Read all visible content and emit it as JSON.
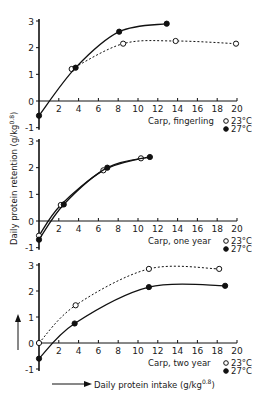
{
  "chart_data": [
    {
      "type": "line",
      "title": "Carp, fingerling",
      "xlabel": "Daily protein intake (g/kg^0.8)",
      "ylabel": "Daily protein retention (g/kg^0.8)",
      "xlim": [
        0,
        20
      ],
      "ylim": [
        -1,
        3
      ],
      "x_ticks": [
        2,
        4,
        6,
        8,
        10,
        12,
        14,
        16,
        18,
        20
      ],
      "y_ticks": [
        -1,
        0,
        1,
        2,
        3
      ],
      "grid": false,
      "series": [
        {
          "name": "23°C",
          "marker": "open-circle",
          "line": "dashed",
          "x": [
            3.3,
            8.5,
            13.8,
            19.9
          ],
          "y": [
            1.2,
            2.15,
            2.25,
            2.15
          ]
        },
        {
          "name": "27°C",
          "marker": "filled-circle",
          "line": "solid",
          "x": [
            0,
            3.7,
            8.1,
            12.9
          ],
          "y": [
            -0.55,
            1.25,
            2.6,
            2.9
          ]
        }
      ]
    },
    {
      "type": "line",
      "title": "Carp, one year",
      "xlabel": "Daily protein intake (g/kg^0.8)",
      "ylabel": "Daily protein retention (g/kg^0.8)",
      "xlim": [
        0,
        20
      ],
      "ylim": [
        -1,
        3
      ],
      "x_ticks": [
        2,
        4,
        6,
        8,
        10,
        12,
        14,
        16,
        18,
        20
      ],
      "y_ticks": [
        -1,
        0,
        1,
        2,
        3
      ],
      "grid": false,
      "series": [
        {
          "name": "23°C",
          "marker": "open-circle",
          "line": "solid",
          "x": [
            0,
            2.2,
            6.5,
            10.3
          ],
          "y": [
            -0.55,
            0.6,
            1.9,
            2.35
          ]
        },
        {
          "name": "27°C",
          "marker": "filled-circle",
          "line": "solid",
          "x": [
            0,
            2.5,
            6.9,
            11.2
          ],
          "y": [
            -0.7,
            0.62,
            2.0,
            2.4
          ]
        }
      ]
    },
    {
      "type": "line",
      "title": "Carp, two year",
      "xlabel": "Daily protein intake (g/kg^0.8)",
      "ylabel": "Daily protein retention (g/kg^0.8)",
      "xlim": [
        0,
        20
      ],
      "ylim": [
        -1,
        3
      ],
      "x_ticks": [
        2,
        4,
        6,
        8,
        10,
        12,
        14,
        16,
        18,
        20
      ],
      "y_ticks": [
        -1,
        0,
        1,
        2,
        3
      ],
      "grid": false,
      "series": [
        {
          "name": "23°C",
          "marker": "open-circle",
          "line": "dashed",
          "x": [
            0,
            3.7,
            11.1,
            18.2
          ],
          "y": [
            0,
            1.45,
            2.85,
            2.85
          ]
        },
        {
          "name": "27°C",
          "marker": "filled-circle",
          "line": "solid",
          "x": [
            0,
            3.6,
            11.1,
            18.8
          ],
          "y": [
            -0.6,
            0.75,
            2.15,
            2.2
          ]
        }
      ]
    }
  ],
  "labels": {
    "ylabel": "Daily protein retention (g/kg",
    "ylabel_sup": "0.8",
    "xlabel": "Daily protein intake (g/kg",
    "xlabel_sup": "0.8",
    "legend_23": "23°C",
    "legend_27": "27°C",
    "panel1": "Carp, fingerling",
    "panel2": "Carp, one year",
    "panel3": "Carp, two year"
  }
}
